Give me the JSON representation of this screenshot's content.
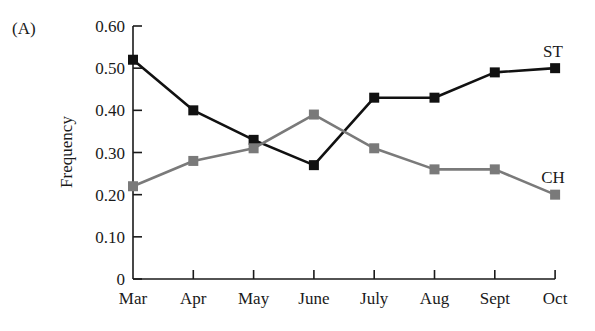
{
  "panel_label": "(A)",
  "chart_data": {
    "type": "line",
    "title": "",
    "panel": "(A)",
    "xlabel": "",
    "ylabel": "Frequency",
    "categories": [
      "Mar",
      "Apr",
      "May",
      "June",
      "July",
      "Aug",
      "Sept",
      "Oct"
    ],
    "yticks": [
      "0",
      "0.10",
      "0.20",
      "0.30",
      "0.40",
      "0.50",
      "0.60"
    ],
    "ylim": [
      0,
      0.6
    ],
    "grid": false,
    "legend": "inline labels at line ends",
    "series": [
      {
        "name": "ST",
        "color": "#111111",
        "marker": "square",
        "values": [
          0.52,
          0.4,
          0.33,
          0.27,
          0.43,
          0.43,
          0.49,
          0.5
        ]
      },
      {
        "name": "CH",
        "color": "#7a7a7a",
        "marker": "square",
        "values": [
          0.22,
          0.28,
          0.31,
          0.39,
          0.31,
          0.26,
          0.26,
          0.2
        ]
      }
    ]
  }
}
